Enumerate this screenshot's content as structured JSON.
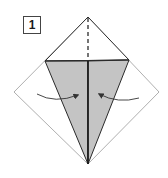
{
  "step": {
    "number": "1"
  },
  "diagram": {
    "instruction_arrows": [
      "fold-left-edge-to-center",
      "fold-right-edge-to-center"
    ],
    "colors": {
      "paper_back": "#ffffff",
      "paper_folded": "#c4c4c4",
      "outline": "#2a2a2a",
      "faint_outline": "#9a9a9a",
      "arrow": "#333333"
    },
    "icons": {
      "valley_fold_line": "dashed-line",
      "fold_arrow": "curved-arrow"
    }
  }
}
